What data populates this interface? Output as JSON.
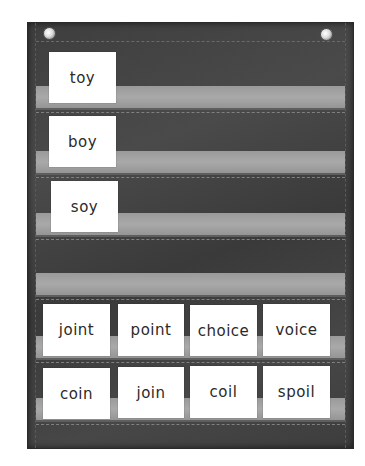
{
  "scene": {
    "subject": "pocket chart with word cards",
    "board_color": "#414141",
    "strip_color": "#a2a2a2",
    "card_color": "#ffffff"
  },
  "rows": [
    {
      "cards": [
        "toy"
      ]
    },
    {
      "cards": [
        "boy"
      ]
    },
    {
      "cards": [
        "soy"
      ]
    },
    {
      "cards": []
    },
    {
      "cards": [
        "joint",
        "point",
        "choice",
        "voice"
      ]
    },
    {
      "cards": [
        "coin",
        "join",
        "coil",
        "spoil"
      ]
    }
  ]
}
